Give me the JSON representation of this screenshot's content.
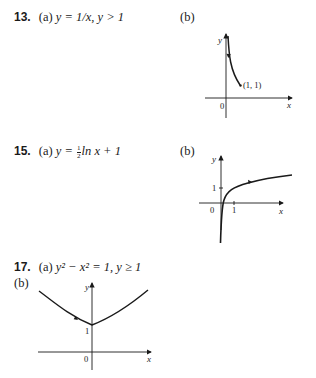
{
  "problems": [
    {
      "number": "13.",
      "part_a_label": "(a)",
      "equation": "y = 1/x, y > 1",
      "part_b_label": "(b)",
      "graph": {
        "axis_x_label": "x",
        "axis_y_label": "y",
        "origin_label": "0",
        "point_label": "(1, 1)"
      }
    },
    {
      "number": "15.",
      "part_a_label": "(a)",
      "equation_pre": "y = ",
      "frac_num": "1",
      "frac_den": "2",
      "equation_post": "ln x + 1",
      "part_b_label": "(b)",
      "graph": {
        "axis_x_label": "x",
        "axis_y_label": "y",
        "origin_label": "0",
        "x_tick_label": "1",
        "y_tick_label": "1"
      }
    },
    {
      "number": "17.",
      "part_a_label": "(a)",
      "equation": "y² − x² = 1, y ≥ 1",
      "part_b_label": "(b)",
      "graph": {
        "axis_x_label": "x",
        "axis_y_label": "y",
        "origin_label": "0",
        "y_tick_label": "1"
      }
    }
  ]
}
